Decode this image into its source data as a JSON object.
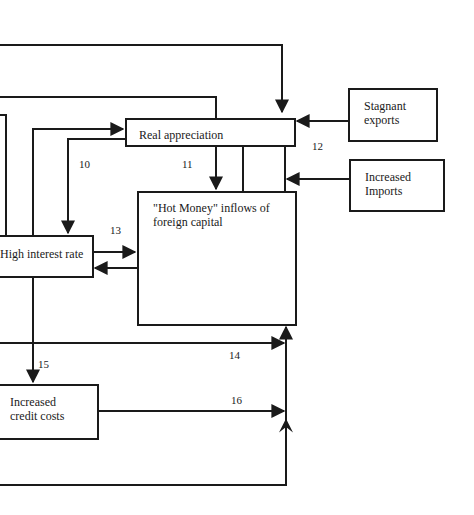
{
  "diagram": {
    "nodes": {
      "real_appreciation": "Real appreciation",
      "stagnant_exports": {
        "line1": "Stagnant",
        "line2": "exports"
      },
      "increased_imports": {
        "line1": "Increased",
        "line2": "Imports"
      },
      "hot_money": {
        "line1": "\"Hot Money\" inflows of",
        "line2": "foreign capital"
      },
      "high_interest_rate": "High interest rate",
      "increased_credit_costs": {
        "line1": "Increased",
        "line2": "credit costs"
      }
    },
    "edge_labels": {
      "e10": "10",
      "e11": "11",
      "e12": "12",
      "e13": "13",
      "e14": "14",
      "e15": "15",
      "e16": "16"
    },
    "colors": {
      "line": "#1a1a1a",
      "background": "#ffffff"
    }
  }
}
